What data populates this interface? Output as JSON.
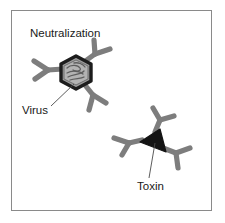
{
  "figure": {
    "title": "Neutralization",
    "border_color": "#8a8a8a",
    "background_color": "#ffffff",
    "text_color": "#1a1a1a",
    "labels": {
      "virus": "Virus",
      "toxin": "Toxin"
    },
    "colors": {
      "antibody": "#7d7d7d",
      "antibody_dark": "#6b6b6b",
      "capsid_outline": "#1c1c1c",
      "capsid_fill": "#9d9d9d",
      "capsid_inner_fill": "#b3b3b3",
      "nucleic_acid": "#5e5e5e",
      "toxin_fill": "#141414",
      "leader_line": "#4a4a4a"
    },
    "elements": {
      "virus_particle": "hexagonal-capsid-with-nucleic-acid",
      "toxin_particle": "dark-triangle",
      "antibody_count_virus": 3,
      "antibody_count_toxin": 3
    }
  }
}
